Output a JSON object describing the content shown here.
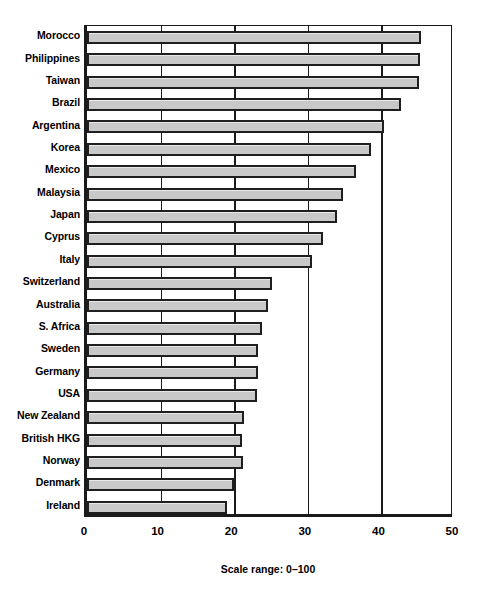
{
  "chart_data": {
    "type": "bar",
    "orientation": "horizontal",
    "title": "",
    "xlabel": "",
    "ylabel": "",
    "caption": "Scale range: 0–100",
    "xlim": [
      0,
      50
    ],
    "xticks": [
      0,
      10,
      20,
      30,
      40,
      50
    ],
    "xtick_labels": [
      "0",
      "10",
      "20",
      "30",
      "40",
      "50"
    ],
    "grid": true,
    "grid_axis": "x",
    "legend": false,
    "bar_fill_color": "#c9c9c9",
    "bar_edge_color": "#1f1f1f",
    "categories": [
      "Morocco",
      "Philippines",
      "Taiwan",
      "Brazil",
      "Argentina",
      "Korea",
      "Mexico",
      "Malaysia",
      "Japan",
      "Cyprus",
      "Italy",
      "Switzerland",
      "Australia",
      "S. Africa",
      "Sweden",
      "Germany",
      "USA",
      "New Zealand",
      "British HKG",
      "Norway",
      "Denmark",
      "Ireland"
    ],
    "values": [
      45.4,
      45.2,
      45.1,
      42.7,
      40.4,
      38.6,
      36.6,
      34.8,
      34.0,
      32.0,
      30.6,
      25.1,
      24.6,
      23.8,
      23.3,
      23.2,
      23.1,
      21.3,
      21.1,
      21.2,
      20.0,
      19.0
    ]
  }
}
